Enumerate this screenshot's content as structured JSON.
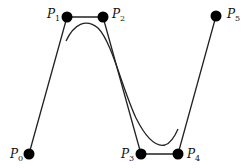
{
  "diagram": {
    "type": "bezier-control-polygon",
    "control_points": [
      {
        "id": "P0",
        "label": "P",
        "sub": "0",
        "x": 29,
        "y": 154,
        "label_x": 10,
        "label_y": 158
      },
      {
        "id": "P1",
        "label": "P",
        "sub": "1",
        "x": 67,
        "y": 17,
        "label_x": 47,
        "label_y": 18
      },
      {
        "id": "P2",
        "label": "P",
        "sub": "2",
        "x": 103,
        "y": 17,
        "label_x": 112,
        "label_y": 18
      },
      {
        "id": "P3",
        "label": "P",
        "sub": "3",
        "x": 141,
        "y": 154,
        "label_x": 121,
        "label_y": 158
      },
      {
        "id": "P4",
        "label": "P",
        "sub": "4",
        "x": 178,
        "y": 154,
        "label_x": 187,
        "label_y": 158
      },
      {
        "id": "P5",
        "label": "P",
        "sub": "5",
        "x": 216,
        "y": 16,
        "label_x": 227,
        "label_y": 18
      }
    ],
    "colors": {
      "polygon": "#222222",
      "curve": "#222222",
      "point": "#000000",
      "background": "#ffffff"
    }
  }
}
